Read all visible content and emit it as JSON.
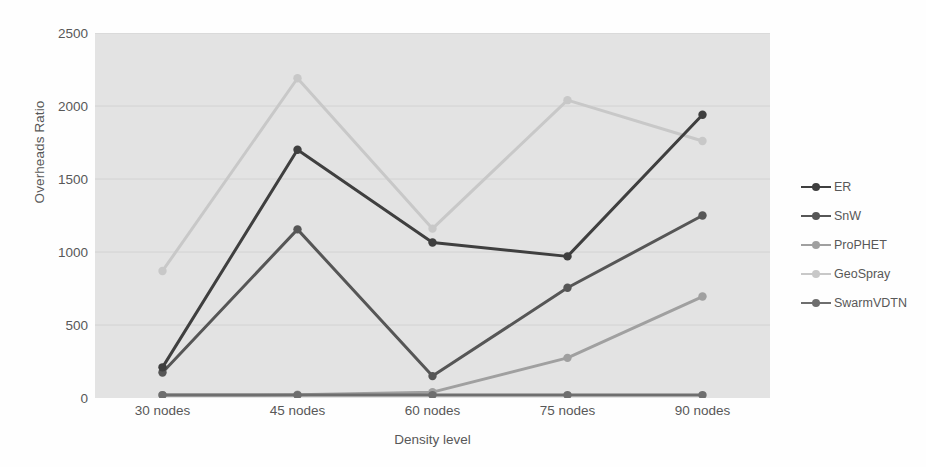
{
  "chart_data": {
    "type": "line",
    "title": "",
    "xlabel": "Density level",
    "ylabel": "Overheads Ratio",
    "categories": [
      "30 nodes",
      "45 nodes",
      "60 nodes",
      "75 nodes",
      "90 nodes"
    ],
    "ylim": [
      0,
      2500
    ],
    "yticks": [
      0,
      500,
      1000,
      1500,
      2000,
      2500
    ],
    "ytick_labels": [
      "0",
      "500",
      "1000",
      "1500",
      "2000",
      "2500"
    ],
    "grid": true,
    "legend_position": "right",
    "series": [
      {
        "name": "ER",
        "color": "#3f3f3f",
        "values": [
          210,
          1700,
          1065,
          970,
          1940
        ]
      },
      {
        "name": "SnW",
        "color": "#565656",
        "values": [
          175,
          1155,
          150,
          755,
          1250
        ]
      },
      {
        "name": "ProPHET",
        "color": "#a0a0a0",
        "values": [
          20,
          22,
          40,
          275,
          695
        ]
      },
      {
        "name": "GeoSpray",
        "color": "#c8c8c8",
        "values": [
          870,
          2190,
          1160,
          2040,
          1760
        ]
      },
      {
        "name": "SwarmVDTN",
        "color": "#6e6e6e",
        "values": [
          20,
          20,
          20,
          20,
          20
        ]
      }
    ]
  },
  "legend": {
    "items": [
      {
        "label": "ER"
      },
      {
        "label": "SnW"
      },
      {
        "label": "ProPHET"
      },
      {
        "label": "GeoSpray"
      },
      {
        "label": "SwarmVDTN"
      }
    ]
  },
  "axes": {
    "y_title": "Overheads Ratio",
    "x_title": "Density level"
  }
}
